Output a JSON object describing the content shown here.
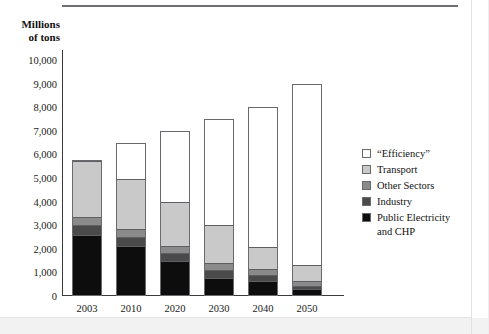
{
  "figure": {
    "title_cropped": "",
    "axis_title": "Millions\nof tons"
  },
  "chart_data": {
    "type": "bar",
    "stacked": true,
    "title": "",
    "xlabel": "",
    "ylabel": "Millions of tons",
    "ylim": [
      0,
      10000
    ],
    "ytick_values": [
      0,
      1000,
      2000,
      3000,
      4000,
      5000,
      6000,
      7000,
      8000,
      9000,
      10000
    ],
    "ytick_labels": [
      "0",
      "1,000",
      "2,000",
      "3,000",
      "4,000",
      "5,000",
      "6,000",
      "7,000",
      "8,000",
      "9,000",
      "10,000"
    ],
    "categories": [
      "2003",
      "2010",
      "2020",
      "2030",
      "2040",
      "2050"
    ],
    "grid": false,
    "legend_position": "right",
    "series": [
      {
        "name": "Public Electricity and CHP",
        "color": "#0d0d0d",
        "values": [
          2600,
          2100,
          1450,
          750,
          600,
          250
        ]
      },
      {
        "name": "Industry",
        "color": "#4a4a4a",
        "values": [
          400,
          400,
          350,
          300,
          250,
          150
        ]
      },
      {
        "name": "Other Sectors",
        "color": "#8a8a8a",
        "values": [
          350,
          350,
          300,
          300,
          250,
          200
        ]
      },
      {
        "name": "Transport",
        "color": "#c9c9c9",
        "values": [
          2400,
          2150,
          1900,
          1650,
          950,
          700
        ]
      },
      {
        "name": "“Efficiency”",
        "color": "#ffffff",
        "values": [
          0,
          1500,
          3000,
          4500,
          5950,
          7700
        ]
      }
    ],
    "totals": [
      5750,
      6500,
      7000,
      7500,
      8000,
      9000
    ]
  },
  "legend": {
    "items": [
      {
        "label": "“Efficiency”",
        "color": "#ffffff"
      },
      {
        "label": "Transport",
        "color": "#c9c9c9"
      },
      {
        "label": "Other Sectors",
        "color": "#8a8a8a"
      },
      {
        "label": "Industry",
        "color": "#4a4a4a"
      },
      {
        "label": "Public Electricity\nand CHP",
        "color": "#0d0d0d"
      }
    ]
  }
}
